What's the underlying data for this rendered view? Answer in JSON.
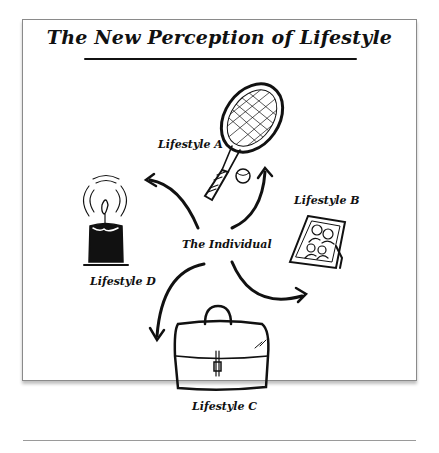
{
  "title": "The New Perception of Lifestyle",
  "center": {
    "label": "The Individual"
  },
  "lifestyles": [
    {
      "id": "A",
      "label": "Lifestyle A",
      "icon": "tennis-racket-icon"
    },
    {
      "id": "B",
      "label": "Lifestyle B",
      "icon": "family-photo-frame-icon"
    },
    {
      "id": "C",
      "label": "Lifestyle C",
      "icon": "briefcase-icon"
    },
    {
      "id": "D",
      "label": "Lifestyle D",
      "icon": "candle-icon"
    }
  ],
  "colors": {
    "ink": "#111111",
    "frame": "#8a8a8a",
    "background": "#ffffff"
  }
}
